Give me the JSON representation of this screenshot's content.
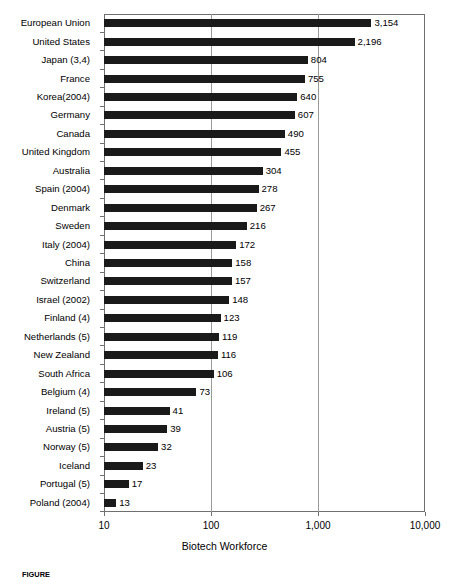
{
  "chart_data": {
    "type": "bar",
    "orientation": "horizontal",
    "title": "",
    "xlabel": "Biotech Workforce",
    "ylabel": "",
    "xscale": "log",
    "xlim": [
      10,
      10000
    ],
    "xticks": [
      10,
      100,
      1000,
      10000
    ],
    "xtick_labels": [
      "10",
      "100",
      "1,000",
      "10,000"
    ],
    "grid": "vertical-major",
    "legend": "none",
    "bar_color": "#1a1a1a",
    "categories": [
      "European Union",
      "United States",
      "Japan (3,4)",
      "France",
      "Korea(2004)",
      "Germany",
      "Canada",
      "United Kingdom",
      "Australia",
      "Spain (2004)",
      "Denmark",
      "Sweden",
      "Italy (2004)",
      "China",
      "Switzerland",
      "Israel (2002)",
      "Finland (4)",
      "Netherlands (5)",
      "New Zealand",
      "South Africa",
      "Belgium (4)",
      "Ireland (5)",
      "Austria (5)",
      "Norway (5)",
      "Iceland",
      "Portugal (5)",
      "Poland (2004)"
    ],
    "values": [
      3154,
      2196,
      804,
      755,
      640,
      607,
      490,
      455,
      304,
      278,
      267,
      216,
      172,
      158,
      157,
      148,
      123,
      119,
      116,
      106,
      73,
      41,
      39,
      32,
      23,
      17,
      13
    ],
    "value_labels": [
      "3,154",
      "2,196",
      "804",
      "755",
      "640",
      "607",
      "490",
      "455",
      "304",
      "278",
      "267",
      "216",
      "172",
      "158",
      "157",
      "148",
      "123",
      "119",
      "116",
      "106",
      "73",
      "41",
      "39",
      "32",
      "23",
      "17",
      "13"
    ]
  },
  "caption": {
    "prefix": "FIGURE",
    "text": "FIGURE"
  }
}
